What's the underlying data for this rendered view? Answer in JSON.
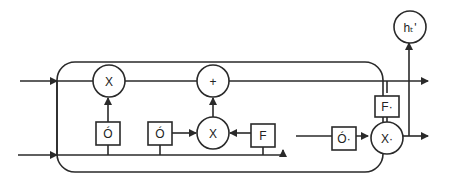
{
  "diagram": {
    "type": "lstm-cell",
    "colors": {
      "line": "#2a2a2a",
      "background": "#ffffff"
    },
    "nodes": {
      "forget_mult": {
        "label": "X",
        "shape": "circle"
      },
      "add": {
        "label": "+",
        "shape": "circle"
      },
      "input_mult": {
        "label": "X",
        "shape": "circle"
      },
      "output_mult": {
        "label": "X·",
        "shape": "circle"
      },
      "output_node": {
        "label": "hₜ'",
        "shape": "circle"
      },
      "forget_gate": {
        "label": "Ó",
        "shape": "box"
      },
      "input_gate": {
        "label": "Ó",
        "shape": "box"
      },
      "candidate": {
        "label": "F",
        "shape": "box"
      },
      "output_gate": {
        "label": "Ó·",
        "shape": "box"
      },
      "cell_tanh": {
        "label": "F·",
        "shape": "box"
      }
    }
  }
}
